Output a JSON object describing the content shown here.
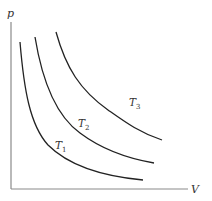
{
  "diagram": {
    "axes": {
      "y_label": "p",
      "x_label": "V",
      "color": "#8a8a8a"
    },
    "curves": [
      {
        "name": "T",
        "subscript": "1",
        "label": "T1"
      },
      {
        "name": "T",
        "subscript": "2",
        "label": "T2"
      },
      {
        "name": "T",
        "subscript": "3",
        "label": "T3"
      }
    ],
    "curve_color": "#222222"
  }
}
